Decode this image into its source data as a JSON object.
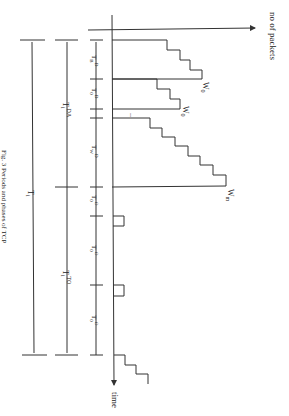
{
  "axes": {
    "y_label": "no of packets",
    "x_label": "time"
  },
  "windows": [
    {
      "label": "W0",
      "sub": "0"
    },
    {
      "label": "W0",
      "sub": "0"
    },
    {
      "label": "Wm",
      "sub": "m"
    }
  ],
  "intervals_inner": [
    "T_B^D",
    "T_0^D",
    "...",
    "T_W^D",
    "T_0^O",
    "T_0^O",
    "T_0^O"
  ],
  "intervals_outer": {
    "da": "T_i^DA",
    "to": "T_i^TO",
    "total": "T_i"
  },
  "caption": "Fig. 3  Periods and phases of TCP",
  "colors": {
    "line": "#333333",
    "background": "#ffffff"
  }
}
